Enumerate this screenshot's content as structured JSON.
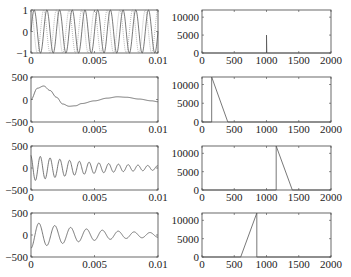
{
  "chart_data": [
    {
      "panel": "row1-left",
      "type": "line",
      "title": "",
      "xlabel": "",
      "ylabel": "",
      "xlim": [
        0,
        0.01
      ],
      "ylim": [
        -1,
        1
      ],
      "x_ticks": [
        "0",
        "0.005",
        "0.01"
      ],
      "y_ticks": [
        "1",
        "0",
        "-1"
      ],
      "series": [
        {
          "name": "sine 1000 Hz (solid)",
          "frequency_hz": 1000,
          "amplitude": 1,
          "cycles": 10
        },
        {
          "name": "sine 1000 Hz (dotted)",
          "frequency_hz": 1000,
          "amplitude": 1,
          "cycles": 10,
          "phase": "shifted"
        }
      ]
    },
    {
      "panel": "row1-right",
      "type": "line",
      "xlim": [
        0,
        2000
      ],
      "ylim": [
        0,
        12000
      ],
      "x_ticks": [
        "0",
        "500",
        "1000",
        "1500",
        "2000"
      ],
      "y_ticks": [
        "10000",
        "5000",
        "0"
      ],
      "series": [
        {
          "name": "spectrum",
          "x": [
            0,
            995,
            1000,
            1000,
            1005,
            2000
          ],
          "y": [
            0,
            0,
            0,
            5000,
            0,
            0
          ]
        }
      ]
    },
    {
      "panel": "row2-left",
      "type": "line",
      "xlim": [
        0,
        0.01
      ],
      "ylim": [
        -500,
        500
      ],
      "x_ticks": [
        "0",
        "0.005",
        "0.01"
      ],
      "y_ticks": [
        "500",
        "0",
        "-500"
      ],
      "series": [
        {
          "name": "filtered signal",
          "x": [
            0,
            0.0005,
            0.001,
            0.0015,
            0.002,
            0.0025,
            0.003,
            0.0035,
            0.004,
            0.005,
            0.006,
            0.0068,
            0.0075,
            0.0085,
            0.0095,
            0.01
          ],
          "y": [
            0,
            250,
            300,
            200,
            50,
            -100,
            -150,
            -140,
            -90,
            -30,
            30,
            60,
            50,
            10,
            -30,
            -50
          ]
        }
      ]
    },
    {
      "panel": "row2-right",
      "type": "line",
      "xlim": [
        0,
        2000
      ],
      "ylim": [
        0,
        12000
      ],
      "x_ticks": [
        "0",
        "500",
        "1000",
        "1500",
        "2000"
      ],
      "y_ticks": [
        "10000",
        "5000",
        "0"
      ],
      "series": [
        {
          "name": "filter response",
          "x": [
            0,
            150,
            150,
            400,
            2000
          ],
          "y": [
            0,
            0,
            12000,
            0,
            0
          ]
        }
      ]
    },
    {
      "panel": "row3-left",
      "type": "line",
      "xlim": [
        0,
        0.01
      ],
      "ylim": [
        -500,
        500
      ],
      "x_ticks": [
        "0",
        "0.005",
        "0.01"
      ],
      "y_ticks": [
        "500",
        "0",
        "-500"
      ],
      "series": [
        {
          "name": "decaying oscillation",
          "envelope_start": 300,
          "envelope_end": 50,
          "cycles": 13
        }
      ]
    },
    {
      "panel": "row3-right",
      "type": "line",
      "xlim": [
        0,
        2000
      ],
      "ylim": [
        0,
        12000
      ],
      "x_ticks": [
        "0",
        "500",
        "1000",
        "1500",
        "2000"
      ],
      "y_ticks": [
        "10000",
        "5000",
        "0"
      ],
      "series": [
        {
          "name": "filter response",
          "x": [
            0,
            1150,
            1150,
            1400,
            2000
          ],
          "y": [
            0,
            0,
            12000,
            0,
            0
          ]
        }
      ]
    },
    {
      "panel": "row4-left",
      "type": "line",
      "xlim": [
        0,
        0.01
      ],
      "ylim": [
        -500,
        500
      ],
      "x_ticks": [
        "0",
        "0.005",
        "0.01"
      ],
      "y_ticks": [
        "500",
        "0",
        "-500"
      ],
      "series": [
        {
          "name": "decaying oscillation",
          "envelope_start": 300,
          "envelope_end": 50,
          "cycles": 8
        }
      ]
    },
    {
      "panel": "row4-right",
      "type": "line",
      "xlim": [
        0,
        2000
      ],
      "ylim": [
        0,
        12000
      ],
      "x_ticks": [
        "0",
        "500",
        "1000",
        "1500",
        "2000"
      ],
      "y_ticks": [
        "10000",
        "5000",
        "0"
      ],
      "series": [
        {
          "name": "filter response",
          "x": [
            0,
            600,
            850,
            850,
            2000
          ],
          "y": [
            0,
            0,
            12000,
            0,
            0
          ]
        }
      ]
    }
  ],
  "layout": {
    "left_box": {
      "x": 31,
      "w": 127
    },
    "right_box": {
      "x": 202,
      "w": 129
    },
    "rows": [
      {
        "y": 10,
        "h": 43
      },
      {
        "y": 77,
        "h": 45
      },
      {
        "y": 146,
        "h": 44
      },
      {
        "y": 213,
        "h": 44
      }
    ]
  },
  "colors": {
    "trace": "#555555",
    "axes": "#444444",
    "background": "#ffffff"
  }
}
